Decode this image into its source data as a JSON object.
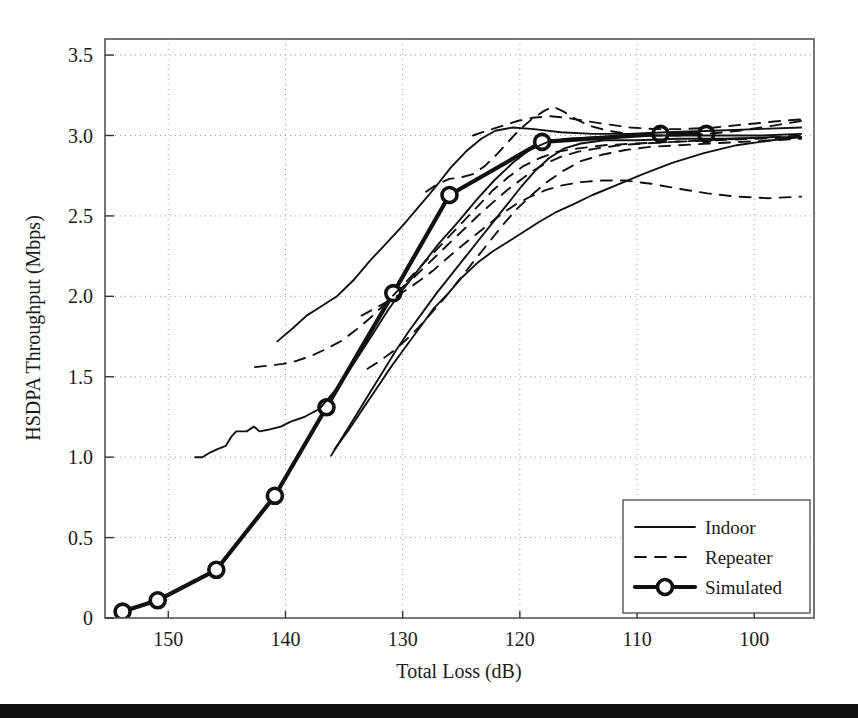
{
  "chart_data": {
    "type": "line",
    "title": "",
    "xlabel": "Total Loss (dB)",
    "ylabel": "HSDPA Throughput (Mbps)",
    "xlim": [
      155.4,
      94.9
    ],
    "ylim": [
      0,
      3.6
    ],
    "x_reversed": true,
    "grid": true,
    "xticks": [
      150,
      140,
      130,
      120,
      110,
      100
    ],
    "xticklabels": [
      "150",
      "140",
      "130",
      "120",
      "110",
      "100"
    ],
    "yticks": [
      0,
      0.5,
      1.0,
      1.5,
      2.0,
      2.5,
      3.0,
      3.5
    ],
    "yticklabels": [
      "0",
      "0.5",
      "1.0",
      "1.5",
      "2.0",
      "2.5",
      "3.0",
      "3.5"
    ],
    "legend_position": "lower right",
    "legend": [
      {
        "label": "Indoor",
        "style": "solid",
        "width": "thin",
        "marker": "none"
      },
      {
        "label": "Repeater",
        "style": "dashed",
        "width": "thin",
        "marker": "none"
      },
      {
        "label": "Simulated",
        "style": "solid",
        "width": "thick",
        "marker": "circle"
      }
    ],
    "series": [
      {
        "name": "Simulated",
        "style": "solid",
        "width": "thick",
        "marker": "circle",
        "points": [
          [
            153.9,
            0.04
          ],
          [
            150.9,
            0.11
          ],
          [
            145.9,
            0.3
          ],
          [
            140.9,
            0.76
          ],
          [
            136.5,
            1.31
          ],
          [
            130.8,
            2.02
          ],
          [
            126.0,
            2.63
          ],
          [
            118.1,
            2.96
          ],
          [
            108.0,
            3.01
          ],
          [
            104.1,
            3.01
          ]
        ]
      },
      {
        "name": "Indoor-1",
        "style": "solid",
        "width": "thin",
        "marker": "none",
        "points": [
          [
            147.7,
            1.0
          ],
          [
            147.1,
            1.0
          ],
          [
            146.4,
            1.03
          ],
          [
            145.8,
            1.05
          ],
          [
            145.1,
            1.07
          ],
          [
            144.6,
            1.13
          ],
          [
            144.2,
            1.16
          ],
          [
            143.3,
            1.16
          ],
          [
            142.7,
            1.19
          ],
          [
            142.2,
            1.16
          ],
          [
            141.5,
            1.17
          ],
          [
            140.4,
            1.19
          ],
          [
            139.6,
            1.22
          ],
          [
            138.4,
            1.25
          ],
          [
            137.1,
            1.3
          ],
          [
            135.6,
            1.43
          ],
          [
            134.2,
            1.58
          ],
          [
            132.6,
            1.76
          ],
          [
            131.2,
            1.92
          ],
          [
            129.9,
            2.05
          ],
          [
            128.4,
            2.19
          ],
          [
            126.9,
            2.33
          ],
          [
            125.3,
            2.46
          ],
          [
            123.7,
            2.6
          ],
          [
            122.2,
            2.72
          ],
          [
            120.6,
            2.83
          ],
          [
            119.2,
            2.91
          ],
          [
            117.6,
            2.96
          ],
          [
            116.0,
            2.98
          ],
          [
            113.5,
            2.99
          ],
          [
            110.5,
            3.0
          ],
          [
            107.0,
            3.0
          ],
          [
            103.5,
            3.0
          ],
          [
            99.5,
            3.0
          ],
          [
            96.0,
            3.01
          ]
        ]
      },
      {
        "name": "Indoor-2",
        "style": "solid",
        "width": "thin",
        "marker": "none",
        "points": [
          [
            140.7,
            1.72
          ],
          [
            139.4,
            1.8
          ],
          [
            138.2,
            1.88
          ],
          [
            136.9,
            1.94
          ],
          [
            135.6,
            2.0
          ],
          [
            134.2,
            2.1
          ],
          [
            132.8,
            2.22
          ],
          [
            131.4,
            2.33
          ],
          [
            130.0,
            2.44
          ],
          [
            128.6,
            2.56
          ],
          [
            127.2,
            2.68
          ],
          [
            125.9,
            2.8
          ],
          [
            124.6,
            2.9
          ],
          [
            123.3,
            2.98
          ],
          [
            122.1,
            3.03
          ],
          [
            120.6,
            3.05
          ],
          [
            118.8,
            3.04
          ],
          [
            116.5,
            3.02
          ],
          [
            113.8,
            3.01
          ],
          [
            110.8,
            3.01
          ],
          [
            107.4,
            3.02
          ],
          [
            103.6,
            3.03
          ],
          [
            99.8,
            3.04
          ],
          [
            96.0,
            3.05
          ]
        ]
      },
      {
        "name": "Indoor-3",
        "style": "solid",
        "width": "thin",
        "marker": "none",
        "points": [
          [
            136.1,
            1.01
          ],
          [
            135.0,
            1.14
          ],
          [
            133.9,
            1.27
          ],
          [
            132.8,
            1.4
          ],
          [
            131.7,
            1.53
          ],
          [
            130.6,
            1.66
          ],
          [
            129.5,
            1.78
          ],
          [
            128.3,
            1.9
          ],
          [
            127.1,
            2.02
          ],
          [
            125.9,
            2.13
          ],
          [
            124.7,
            2.24
          ],
          [
            123.5,
            2.35
          ],
          [
            122.3,
            2.46
          ],
          [
            121.1,
            2.57
          ],
          [
            119.9,
            2.68
          ],
          [
            118.7,
            2.78
          ],
          [
            117.5,
            2.86
          ],
          [
            116.2,
            2.92
          ],
          [
            114.8,
            2.95
          ],
          [
            112.8,
            2.97
          ],
          [
            110.0,
            2.97
          ],
          [
            106.5,
            2.98
          ],
          [
            102.5,
            2.98
          ],
          [
            98.5,
            2.99
          ],
          [
            96.0,
            2.99
          ]
        ]
      },
      {
        "name": "Indoor-4",
        "style": "solid",
        "width": "thin",
        "marker": "none",
        "points": [
          [
            135.8,
            1.05
          ],
          [
            134.6,
            1.17
          ],
          [
            133.4,
            1.3
          ],
          [
            132.2,
            1.43
          ],
          [
            131.0,
            1.56
          ],
          [
            129.8,
            1.68
          ],
          [
            128.6,
            1.8
          ],
          [
            127.4,
            1.92
          ],
          [
            126.1,
            2.02
          ],
          [
            124.9,
            2.12
          ],
          [
            123.6,
            2.21
          ],
          [
            122.3,
            2.28
          ],
          [
            121.0,
            2.34
          ],
          [
            119.7,
            2.4
          ],
          [
            118.4,
            2.46
          ],
          [
            117.0,
            2.52
          ],
          [
            115.5,
            2.57
          ],
          [
            113.8,
            2.63
          ],
          [
            111.8,
            2.69
          ],
          [
            109.5,
            2.76
          ],
          [
            107.0,
            2.83
          ],
          [
            104.3,
            2.89
          ],
          [
            101.5,
            2.94
          ],
          [
            98.5,
            2.97
          ],
          [
            96.0,
            2.99
          ]
        ]
      },
      {
        "name": "Repeater-1",
        "style": "dashed",
        "width": "thin",
        "marker": "none",
        "points": [
          [
            142.6,
            1.56
          ],
          [
            141.4,
            1.57
          ],
          [
            140.2,
            1.58
          ],
          [
            139.0,
            1.6
          ],
          [
            137.8,
            1.63
          ],
          [
            136.6,
            1.67
          ],
          [
            135.3,
            1.72
          ],
          [
            134.0,
            1.79
          ],
          [
            132.7,
            1.87
          ],
          [
            131.4,
            1.96
          ],
          [
            130.1,
            2.06
          ],
          [
            128.8,
            2.16
          ],
          [
            127.5,
            2.26
          ],
          [
            126.2,
            2.36
          ],
          [
            124.9,
            2.46
          ],
          [
            123.6,
            2.56
          ],
          [
            122.3,
            2.66
          ],
          [
            121.0,
            2.74
          ],
          [
            119.7,
            2.81
          ],
          [
            118.3,
            2.86
          ],
          [
            116.8,
            2.9
          ],
          [
            115.0,
            2.92
          ],
          [
            112.8,
            2.94
          ],
          [
            110.0,
            2.95
          ],
          [
            107.0,
            2.96
          ],
          [
            103.5,
            2.97
          ],
          [
            99.8,
            2.98
          ],
          [
            96.0,
            2.99
          ]
        ]
      },
      {
        "name": "Repeater-2",
        "style": "dashed",
        "width": "thin",
        "marker": "none",
        "points": [
          [
            128.0,
            2.65
          ],
          [
            127.0,
            2.7
          ],
          [
            126.0,
            2.73
          ],
          [
            125.0,
            2.74
          ],
          [
            124.0,
            2.76
          ],
          [
            123.0,
            2.81
          ],
          [
            122.0,
            2.88
          ],
          [
            121.0,
            2.96
          ],
          [
            120.0,
            3.04
          ],
          [
            119.0,
            3.1
          ],
          [
            118.0,
            3.15
          ],
          [
            117.2,
            3.18
          ],
          [
            116.3,
            3.15
          ],
          [
            115.2,
            3.1
          ],
          [
            114.0,
            3.06
          ],
          [
            112.5,
            3.03
          ],
          [
            110.8,
            3.01
          ],
          [
            108.8,
            3.0
          ],
          [
            106.5,
            3.0
          ],
          [
            104.0,
            3.01
          ],
          [
            101.3,
            3.03
          ],
          [
            98.5,
            3.06
          ],
          [
            96.0,
            3.09
          ]
        ]
      },
      {
        "name": "Repeater-3",
        "style": "dashed",
        "width": "thin",
        "marker": "none",
        "points": [
          [
            130.3,
            2.04
          ],
          [
            129.3,
            2.1
          ],
          [
            128.3,
            2.17
          ],
          [
            127.3,
            2.24
          ],
          [
            126.3,
            2.31
          ],
          [
            125.3,
            2.38
          ],
          [
            124.3,
            2.45
          ],
          [
            123.3,
            2.52
          ],
          [
            122.2,
            2.59
          ],
          [
            121.1,
            2.66
          ],
          [
            120.0,
            2.72
          ],
          [
            118.9,
            2.78
          ],
          [
            117.7,
            2.83
          ],
          [
            116.4,
            2.87
          ],
          [
            115.0,
            2.9
          ],
          [
            113.4,
            2.92
          ],
          [
            111.5,
            2.94
          ],
          [
            109.4,
            2.95
          ],
          [
            107.0,
            2.96
          ],
          [
            104.2,
            2.97
          ],
          [
            101.2,
            2.98
          ],
          [
            98.2,
            2.99
          ],
          [
            96.0,
            3.0
          ]
        ]
      },
      {
        "name": "Repeater-4",
        "style": "dashed",
        "width": "thin",
        "marker": "none",
        "points": [
          [
            133.5,
            1.88
          ],
          [
            132.5,
            1.92
          ],
          [
            131.5,
            1.96
          ],
          [
            130.5,
            2.0
          ],
          [
            129.5,
            2.05
          ],
          [
            128.5,
            2.1
          ],
          [
            127.4,
            2.16
          ],
          [
            126.3,
            2.23
          ],
          [
            125.2,
            2.3
          ],
          [
            124.0,
            2.37
          ],
          [
            122.8,
            2.44
          ],
          [
            121.6,
            2.51
          ],
          [
            120.4,
            2.57
          ],
          [
            119.1,
            2.62
          ],
          [
            117.8,
            2.66
          ],
          [
            116.4,
            2.69
          ],
          [
            114.8,
            2.71
          ],
          [
            113.0,
            2.72
          ],
          [
            111.0,
            2.72
          ],
          [
            108.8,
            2.7
          ],
          [
            106.5,
            2.67
          ],
          [
            104.0,
            2.64
          ],
          [
            101.5,
            2.62
          ],
          [
            98.8,
            2.61
          ],
          [
            96.0,
            2.62
          ]
        ]
      },
      {
        "name": "Repeater-5",
        "style": "dashed",
        "width": "thin",
        "marker": "none",
        "points": [
          [
            133.0,
            1.55
          ],
          [
            131.9,
            1.6
          ],
          [
            130.8,
            1.66
          ],
          [
            129.7,
            1.73
          ],
          [
            128.6,
            1.81
          ],
          [
            127.5,
            1.9
          ],
          [
            126.3,
            2.0
          ],
          [
            125.1,
            2.11
          ],
          [
            123.9,
            2.22
          ],
          [
            122.7,
            2.33
          ],
          [
            121.5,
            2.44
          ],
          [
            120.3,
            2.54
          ],
          [
            119.0,
            2.63
          ],
          [
            117.7,
            2.71
          ],
          [
            116.3,
            2.78
          ],
          [
            114.8,
            2.84
          ],
          [
            113.0,
            2.88
          ],
          [
            111.0,
            2.91
          ],
          [
            108.8,
            2.93
          ],
          [
            106.4,
            2.94
          ],
          [
            103.8,
            2.95
          ],
          [
            101.0,
            2.96
          ],
          [
            98.2,
            2.97
          ],
          [
            96.0,
            2.98
          ]
        ]
      },
      {
        "name": "Repeater-6",
        "style": "dashed",
        "width": "thin",
        "marker": "none",
        "points": [
          [
            124.0,
            3.0
          ],
          [
            122.8,
            3.03
          ],
          [
            121.5,
            3.06
          ],
          [
            120.2,
            3.09
          ],
          [
            118.9,
            3.11
          ],
          [
            117.5,
            3.12
          ],
          [
            116.0,
            3.11
          ],
          [
            114.4,
            3.09
          ],
          [
            112.6,
            3.07
          ],
          [
            110.6,
            3.05
          ],
          [
            108.4,
            3.04
          ],
          [
            106.0,
            3.04
          ],
          [
            103.4,
            3.05
          ],
          [
            100.6,
            3.07
          ],
          [
            97.8,
            3.09
          ],
          [
            96.0,
            3.1
          ]
        ]
      }
    ]
  }
}
